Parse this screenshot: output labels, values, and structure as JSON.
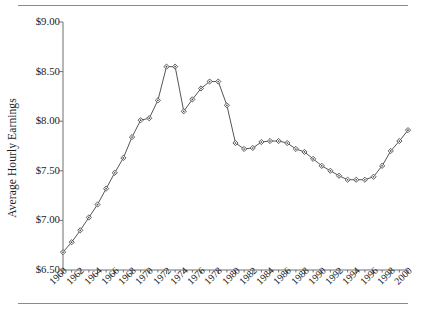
{
  "figure": {
    "y_axis_title": "Average Hourly Earnings",
    "rule_color": "#8a8a8a",
    "axis_color": "#6e6e6e",
    "line_color": "#55555a",
    "marker_color": "#4a4a4f"
  },
  "chart_data": {
    "type": "line",
    "title": "",
    "subtitle": "",
    "xlabel": "",
    "ylabel": "Average Hourly Earnings",
    "xlim": [
      1960,
      2000
    ],
    "ylim": [
      6.5,
      9.0
    ],
    "ytick_values": [
      6.5,
      7.0,
      7.5,
      8.0,
      8.5,
      9.0
    ],
    "ytick_labels": [
      "$6.50",
      "$7.00",
      "$7.50",
      "$8.00",
      "$8.50",
      "$9.00"
    ],
    "ytick_format": "$0.00",
    "xtick_labels": [
      "1960",
      "1962",
      "1964",
      "1966",
      "1968",
      "1970",
      "1972",
      "1974",
      "1976",
      "1978",
      "1980",
      "1982",
      "1984",
      "1986",
      "1988",
      "1990",
      "1992",
      "1994",
      "1996",
      "1998",
      "2000"
    ],
    "xtick_step": 2,
    "xtick_rotation": -45,
    "minor_tick_step": 1,
    "grid": false,
    "legend": null,
    "marker": "diamond",
    "x": [
      1960,
      1961,
      1962,
      1963,
      1964,
      1965,
      1966,
      1967,
      1968,
      1969,
      1970,
      1971,
      1972,
      1973,
      1974,
      1975,
      1976,
      1977,
      1978,
      1979,
      1980,
      1981,
      1982,
      1983,
      1984,
      1985,
      1986,
      1987,
      1988,
      1989,
      1990,
      1991,
      1992,
      1993,
      1994,
      1995,
      1996,
      1997,
      1998,
      1999,
      2000
    ],
    "values": [
      6.68,
      6.78,
      6.9,
      7.03,
      7.16,
      7.32,
      7.48,
      7.63,
      7.84,
      8.01,
      8.03,
      8.21,
      8.55,
      8.55,
      8.1,
      8.22,
      8.33,
      8.4,
      8.4,
      8.16,
      7.78,
      7.72,
      7.73,
      7.79,
      7.8,
      7.8,
      7.78,
      7.72,
      7.69,
      7.62,
      7.55,
      7.5,
      7.45,
      7.41,
      7.41,
      7.41,
      7.44,
      7.55,
      7.7,
      7.8,
      7.91
    ],
    "series": [
      {
        "name": "Average Hourly Earnings",
        "values": [
          6.68,
          6.78,
          6.9,
          7.03,
          7.16,
          7.32,
          7.48,
          7.63,
          7.84,
          8.01,
          8.03,
          8.21,
          8.55,
          8.55,
          8.1,
          8.22,
          8.33,
          8.4,
          8.4,
          8.16,
          7.78,
          7.72,
          7.73,
          7.79,
          7.8,
          7.8,
          7.78,
          7.72,
          7.69,
          7.62,
          7.55,
          7.5,
          7.45,
          7.41,
          7.41,
          7.41,
          7.44,
          7.55,
          7.7,
          7.8,
          7.91
        ]
      }
    ]
  }
}
